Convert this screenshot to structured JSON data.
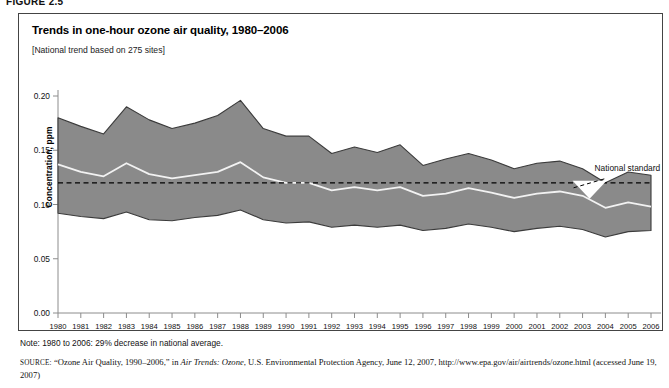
{
  "figure": {
    "label": "FIGURE 2.5",
    "title": "Trends in one-hour ozone air quality, 1980–2006",
    "subtitle": "[National trend based on 275 sites]",
    "note": "Note: 1980 to 2006: 29% decrease in national average.",
    "source_prefix": "SOURCE:",
    "source_text_1": "“Ozone Air Quality, 1990–2006,” in ",
    "source_italic": "Air Trends: Ozone",
    "source_text_2": ", U.S. Environmental Protection Agency, June 12, 2007, http://www.epa.gov/air/airtrends/ozone.html (accessed June 19, 2007)"
  },
  "colors": {
    "band_fill": "#8a8a8a",
    "band_stroke": "#3b3b3b",
    "mean_line": "#f2f2f2",
    "standard_line": "#000000",
    "axis": "#8c8c8c",
    "border": "#444444"
  },
  "chart_data": {
    "type": "area",
    "title": "Trends in one-hour ozone air quality, 1980–2006",
    "subtitle": "[National trend based on 275 sites]",
    "xlabel": "",
    "ylabel": "Concentration, ppm",
    "ylim": [
      0.0,
      0.2
    ],
    "yticks": [
      0.0,
      0.05,
      0.1,
      0.15,
      0.2
    ],
    "ytick_labels": [
      "0.00",
      "0.05",
      "0.10",
      "0.15",
      "0.20"
    ],
    "grid": false,
    "legend_position": "none",
    "annotations": [
      {
        "text": "National standard",
        "value": 0.12,
        "x": 2003.0,
        "style": "dashed-line-with-leader"
      }
    ],
    "x": [
      1980,
      1981,
      1982,
      1983,
      1984,
      1985,
      1986,
      1987,
      1988,
      1989,
      1990,
      1991,
      1992,
      1993,
      1994,
      1995,
      1996,
      1997,
      1998,
      1999,
      2000,
      2001,
      2002,
      2003,
      2004,
      2005,
      2006
    ],
    "xtick_labels": [
      "1980",
      "1981",
      "1982",
      "1983",
      "1984",
      "1985",
      "1986",
      "1987",
      "1988",
      "1989",
      "1990",
      "1991",
      "1992",
      "1993",
      "1994",
      "1995",
      "1996",
      "1997",
      "1998",
      "1999",
      "2000",
      "2001",
      "2002",
      "2003",
      "2004",
      "2005",
      "2006"
    ],
    "series": [
      {
        "name": "90th percentile (upper bound)",
        "values": [
          0.18,
          0.172,
          0.165,
          0.19,
          0.178,
          0.17,
          0.175,
          0.182,
          0.196,
          0.17,
          0.163,
          0.163,
          0.147,
          0.153,
          0.148,
          0.155,
          0.136,
          0.142,
          0.147,
          0.141,
          0.133,
          0.138,
          0.14,
          0.133,
          0.12,
          0.13,
          0.127
        ]
      },
      {
        "name": "National average (mean)",
        "values": [
          0.137,
          0.13,
          0.126,
          0.138,
          0.128,
          0.124,
          0.127,
          0.13,
          0.139,
          0.125,
          0.12,
          0.12,
          0.113,
          0.116,
          0.113,
          0.116,
          0.108,
          0.11,
          0.115,
          0.111,
          0.106,
          0.11,
          0.112,
          0.108,
          0.097,
          0.102,
          0.098
        ]
      },
      {
        "name": "10th percentile (lower bound)",
        "values": [
          0.092,
          0.089,
          0.087,
          0.093,
          0.086,
          0.085,
          0.088,
          0.09,
          0.095,
          0.086,
          0.083,
          0.084,
          0.079,
          0.081,
          0.079,
          0.081,
          0.076,
          0.078,
          0.082,
          0.079,
          0.075,
          0.078,
          0.08,
          0.077,
          0.07,
          0.075,
          0.076
        ]
      },
      {
        "name": "National standard",
        "values": [
          0.12,
          0.12,
          0.12,
          0.12,
          0.12,
          0.12,
          0.12,
          0.12,
          0.12,
          0.12,
          0.12,
          0.12,
          0.12,
          0.12,
          0.12,
          0.12,
          0.12,
          0.12,
          0.12,
          0.12,
          0.12,
          0.12,
          0.12,
          0.12,
          0.12,
          0.12,
          0.12
        ]
      }
    ]
  }
}
